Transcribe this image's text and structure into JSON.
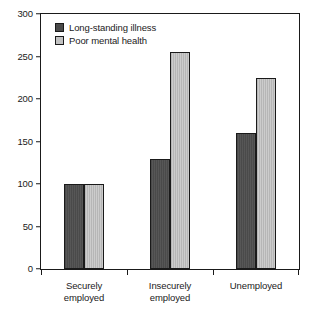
{
  "chart_data": {
    "type": "bar",
    "title": "",
    "subtitle": "",
    "xlabel": "",
    "ylabel": "",
    "categories": [
      "Securely\nemployed",
      "Insecurely\nemployed",
      "Unemployed"
    ],
    "series": [
      {
        "name": "Long-standing illness",
        "color": "#4a4a4a",
        "values": [
          100,
          130,
          160
        ]
      },
      {
        "name": "Poor mental health",
        "color": "#b6b6b6",
        "values": [
          100,
          255,
          225
        ]
      }
    ],
    "ylim": [
      0,
      300
    ],
    "yticks": [
      0,
      50,
      100,
      150,
      200,
      250,
      300
    ],
    "ytick_labels": [
      "0",
      "50",
      "100",
      "150",
      "200",
      "250",
      "300"
    ],
    "grid": false,
    "legend_position": "top-left",
    "frame": "box",
    "axis_color": "#1a1a1a"
  }
}
